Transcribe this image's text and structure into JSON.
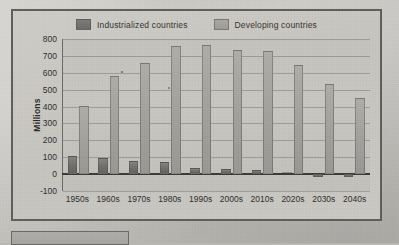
{
  "figure": {
    "y_axis_title": "Millions",
    "legend": [
      {
        "label": "Industrialized countries",
        "color": "#6f6e6b",
        "swatch_name": "legend-swatch-industrialized"
      },
      {
        "label": "Developing countries",
        "color": "#a2a19d",
        "swatch_name": "legend-swatch-developing"
      }
    ],
    "y_ticks": [
      "800",
      "700",
      "600",
      "500",
      "400",
      "300",
      "200",
      "100",
      "0",
      "-100"
    ]
  },
  "chart_data": {
    "type": "bar",
    "title": "",
    "subtitle": "",
    "xlabel": "",
    "ylabel": "Millions",
    "ylim": [
      -100,
      800
    ],
    "ytick_values": [
      800,
      700,
      600,
      500,
      400,
      300,
      200,
      100,
      0,
      -100
    ],
    "grid": true,
    "legend_position": "top-center",
    "categories": [
      "1950s",
      "1960s",
      "1970s",
      "1980s",
      "1990s",
      "2000s",
      "2010s",
      "2020s",
      "2030s",
      "2040s"
    ],
    "series": [
      {
        "name": "Industrialized countries",
        "color": "#6f6e6b",
        "values": [
          110,
          95,
          75,
          70,
          35,
          30,
          22,
          12,
          -20,
          -20
        ]
      },
      {
        "name": "Developing countries",
        "color": "#a2a19d",
        "values": [
          403,
          578,
          660,
          760,
          762,
          735,
          730,
          645,
          535,
          450
        ]
      }
    ]
  }
}
